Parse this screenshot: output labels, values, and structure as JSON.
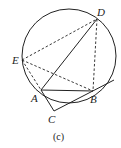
{
  "figure": {
    "caption": "(c)",
    "circle": {
      "cx": 69,
      "cy": 56,
      "r": 47
    },
    "points": {
      "A": {
        "label": "A",
        "x": 41,
        "y": 90
      },
      "B": {
        "label": "B",
        "x": 93,
        "y": 91
      },
      "C": {
        "label": "C",
        "x": 54,
        "y": 111
      },
      "D": {
        "label": "D",
        "x": 97,
        "y": 19
      },
      "E": {
        "label": "E",
        "x": 22,
        "y": 60
      }
    },
    "solid_segments": [
      "A-D",
      "A-B",
      "A-C",
      "C-B-tangent"
    ],
    "dashed_segments": [
      "E-D",
      "E-A",
      "E-B",
      "D-B"
    ],
    "colors": {
      "line": "#222222",
      "background": "#ffffff"
    }
  }
}
